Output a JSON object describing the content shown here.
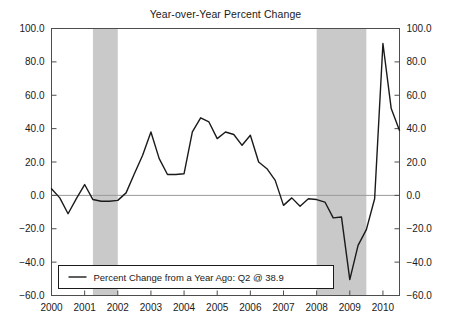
{
  "chart_data": {
    "type": "line",
    "title": "Year-over-Year Percent Change",
    "xlabel": "",
    "ylabel": "",
    "xlim": [
      2000.0,
      2010.5
    ],
    "ylim": [
      -60.0,
      100.0
    ],
    "grid": false,
    "zero_line": true,
    "dual_y_axis": true,
    "y_ticks": [
      100.0,
      80.0,
      60.0,
      40.0,
      20.0,
      0.0,
      -20.0,
      -40.0,
      -60.0
    ],
    "y_tick_labels": [
      "100.0",
      "80.0",
      "60.0",
      "40.0",
      "20.0",
      "0.0",
      "-20.0",
      "-40.0",
      "-60.0"
    ],
    "x_ticks": [
      2000,
      2001,
      2002,
      2003,
      2004,
      2005,
      2006,
      2007,
      2008,
      2009,
      2010
    ],
    "x_tick_labels": [
      "2000",
      "2001",
      "2002",
      "2003",
      "2004",
      "2005",
      "2006",
      "2007",
      "2008",
      "2009",
      "2010"
    ],
    "legend_position": "bottom-left",
    "legend": [
      {
        "name": "Percent Change from a Year Ago: Q2 @ 38.9",
        "color": "#1a1a1a",
        "marker": "line"
      }
    ],
    "annotations": [
      {
        "type": "shaded-band",
        "label": "recession-2001",
        "x_start": 2001.25,
        "x_end": 2002.0,
        "color": "#c9c9c9"
      },
      {
        "type": "shaded-band",
        "label": "recession-2008",
        "x_start": 2008.0,
        "x_end": 2009.5,
        "color": "#c9c9c9"
      }
    ],
    "series": [
      {
        "name": "Percent Change from a Year Ago",
        "color": "#1a1a1a",
        "latest_label": "Q2 @ 38.9",
        "latest_value": 38.9,
        "x": [
          2000.0,
          2000.25,
          2000.5,
          2000.75,
          2001.0,
          2001.25,
          2001.5,
          2001.75,
          2002.0,
          2002.25,
          2002.5,
          2002.75,
          2003.0,
          2003.25,
          2003.5,
          2003.75,
          2004.0,
          2004.25,
          2004.5,
          2004.75,
          2005.0,
          2005.25,
          2005.5,
          2005.75,
          2006.0,
          2006.25,
          2006.5,
          2006.75,
          2007.0,
          2007.25,
          2007.5,
          2007.75,
          2008.0,
          2008.25,
          2008.5,
          2008.75,
          2009.0,
          2009.25,
          2009.5,
          2009.75,
          2010.0,
          2010.25,
          2010.5
        ],
        "values": [
          4.0,
          -1.5,
          -11.0,
          -2.0,
          6.5,
          -2.5,
          -3.5,
          -3.5,
          -3.0,
          1.5,
          13.0,
          24.0,
          38.0,
          22.0,
          12.5,
          12.5,
          13.0,
          38.0,
          46.5,
          44.0,
          34.0,
          38.0,
          36.5,
          30.0,
          36.0,
          20.0,
          16.0,
          9.0,
          -6.0,
          -1.5,
          -6.5,
          -2.0,
          -2.5,
          -4.0,
          -13.5,
          -13.0,
          -50.5,
          -30.0,
          -20.5,
          -2.0,
          91.0,
          52.0,
          38.9
        ]
      }
    ]
  },
  "axes": {
    "left_axis_name": "left-value-axis",
    "right_axis_name": "right-value-axis",
    "bottom_axis_name": "year-axis"
  }
}
